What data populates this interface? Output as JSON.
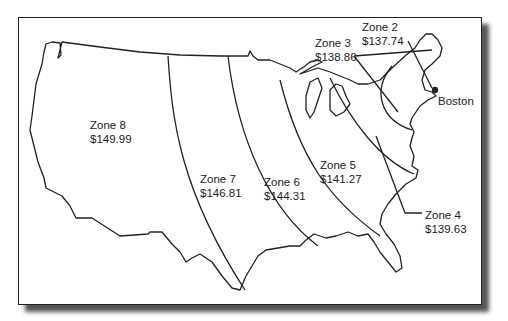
{
  "map": {
    "type": "zone-pricing-map",
    "region": "Contiguous United States",
    "origin_label": "Boston",
    "zones": [
      {
        "name": "Zone 2",
        "price": "$137.74"
      },
      {
        "name": "Zone 3",
        "price": "$138.86"
      },
      {
        "name": "Zone 4",
        "price": "$139.63"
      },
      {
        "name": "Zone 5",
        "price": "$141.27"
      },
      {
        "name": "Zone 6",
        "price": "$144.31"
      },
      {
        "name": "Zone 7",
        "price": "$146.81"
      },
      {
        "name": "Zone 8",
        "price": "$149.99"
      }
    ],
    "colors": {
      "line": "#222222",
      "background": "#ffffff",
      "shadow": "#555555"
    }
  }
}
